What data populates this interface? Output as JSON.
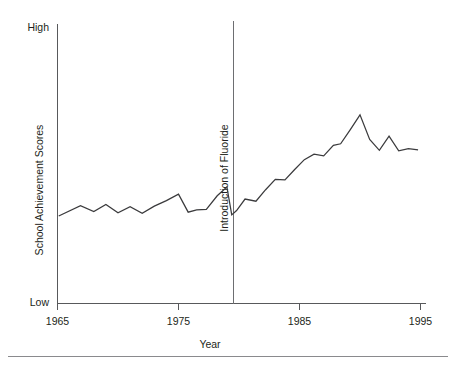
{
  "chart_data": {
    "type": "line",
    "title": "",
    "xlabel": "Year",
    "ylabel": "School Achievement Scores",
    "xlim": [
      1965,
      1995
    ],
    "ylim": [
      0,
      100
    ],
    "grid": false,
    "legend": null,
    "x_ticks": [
      1965,
      1975,
      1985,
      1995
    ],
    "x_tick_labels": [
      "1965",
      "1975",
      "1985",
      "1995"
    ],
    "y_tick_labels": [
      "High",
      "Low"
    ],
    "y_axis_top_label": "High",
    "y_axis_bottom_label": "Low",
    "annotations": [
      {
        "text": "Introduction of Fluoride",
        "type": "vertical-line",
        "x": 1979.5,
        "orientation": "vertical"
      }
    ],
    "series": [
      {
        "name": "School Achievement Scores",
        "x": [
          1965.1,
          1966.9,
          1968.0,
          1969.0,
          1970.0,
          1971.0,
          1972.0,
          1973.0,
          1974.0,
          1975.0,
          1975.8,
          1976.5,
          1977.3,
          1978.2,
          1979.0,
          1979.4,
          1979.8,
          1980.5,
          1981.4,
          1982.2,
          1983.0,
          1983.8,
          1984.6,
          1985.4,
          1986.2,
          1987.0,
          1987.8,
          1988.4,
          1989.2,
          1990.0,
          1990.8,
          1991.6,
          1992.4,
          1993.2,
          1994.0,
          1994.8
        ],
        "values": [
          32.0,
          35.8,
          33.6,
          36.2,
          33.2,
          35.4,
          33.0,
          35.6,
          37.6,
          40.0,
          33.4,
          34.2,
          34.4,
          39.4,
          42.6,
          32.4,
          34.0,
          38.2,
          37.4,
          41.6,
          45.4,
          45.2,
          49.0,
          52.6,
          54.6,
          54.0,
          57.8,
          58.4,
          63.6,
          69.0,
          60.0,
          56.0,
          61.2,
          55.8,
          56.6,
          56.2
        ]
      }
    ]
  },
  "figure": {
    "axis_color": "#58595b",
    "series_color": "#3b3b3d",
    "event_line_color": "#6d6e71",
    "background": "#ffffff"
  }
}
